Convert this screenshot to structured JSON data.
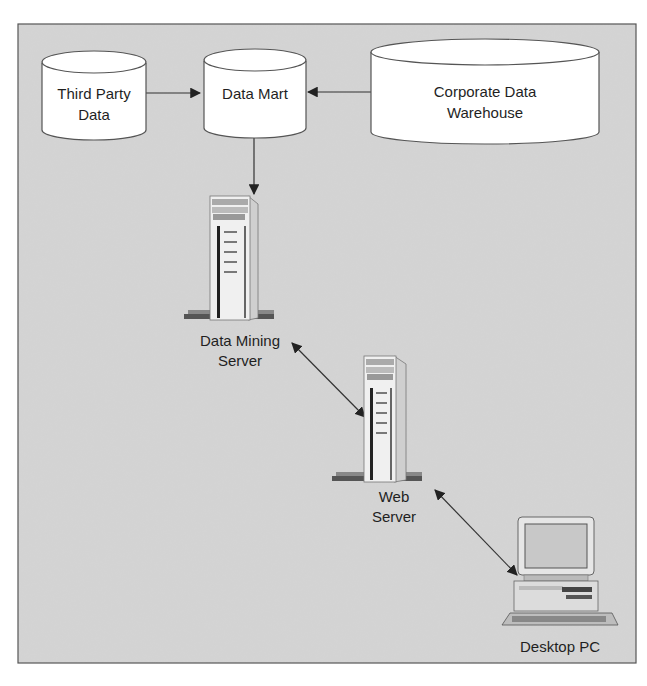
{
  "diagram": {
    "type": "data-mining-architecture",
    "colors": {
      "background": "#d4d4d4",
      "frame_border": "#555555",
      "node_fill": "#ffffff",
      "line": "#333333",
      "text": "#1f1f1f"
    },
    "nodes": {
      "third_party": {
        "kind": "database",
        "line1": "Third Party",
        "line2": "Data"
      },
      "data_mart": {
        "kind": "database",
        "line1": "Data Mart",
        "line2": ""
      },
      "warehouse": {
        "kind": "database",
        "line1": "Corporate Data",
        "line2": "Warehouse"
      },
      "mining_server": {
        "kind": "server",
        "line1": "Data Mining",
        "line2": "Server"
      },
      "web_server": {
        "kind": "server",
        "line1": "Web",
        "line2": "Server"
      },
      "desktop": {
        "kind": "desktop-pc",
        "line1": "Desktop PC"
      }
    },
    "edges": [
      {
        "from": "Third Party Data",
        "to": "Data Mart",
        "direction": "one-way"
      },
      {
        "from": "Corporate Data Warehouse",
        "to": "Data Mart",
        "direction": "one-way"
      },
      {
        "from": "Data Mart",
        "to": "Data Mining Server",
        "direction": "one-way"
      },
      {
        "from": "Data Mining Server",
        "to": "Web Server",
        "direction": "bidirectional"
      },
      {
        "from": "Web Server",
        "to": "Desktop PC",
        "direction": "bidirectional"
      }
    ]
  }
}
